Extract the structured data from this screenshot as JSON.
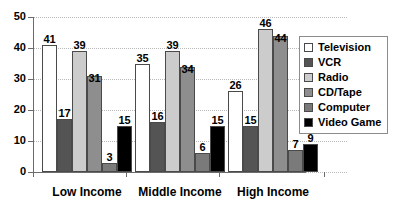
{
  "chart_data": {
    "type": "bar",
    "title": "",
    "xlabel": "",
    "ylabel": "",
    "ylim": [
      0,
      50
    ],
    "yticks": [
      0,
      10,
      20,
      30,
      40,
      50
    ],
    "grid": true,
    "legend_position": "right",
    "categories": [
      "Low Income",
      "Middle Income",
      "High Income"
    ],
    "series": [
      {
        "name": "Television",
        "color": "#ffffff",
        "values": [
          41,
          35,
          26
        ]
      },
      {
        "name": "VCR",
        "color": "#545454",
        "values": [
          17,
          16,
          15
        ]
      },
      {
        "name": "Radio",
        "color": "#cccccc",
        "values": [
          39,
          39,
          46
        ]
      },
      {
        "name": "CD/Tape",
        "color": "#8e8e8e",
        "values": [
          31,
          34,
          44
        ]
      },
      {
        "name": "Computer",
        "color": "#7a7a7a",
        "values": [
          3,
          6,
          7
        ]
      },
      {
        "name": "Video Game",
        "color": "#000000",
        "values": [
          15,
          15,
          9
        ]
      }
    ]
  },
  "axis": {
    "y_tick_labels": [
      "50",
      "40",
      "30",
      "20",
      "10",
      "0"
    ]
  },
  "legend": {
    "items": [
      {
        "label": "Television",
        "color": "#ffffff"
      },
      {
        "label": "VCR",
        "color": "#545454"
      },
      {
        "label": "Radio",
        "color": "#cccccc"
      },
      {
        "label": "CD/Tape",
        "color": "#8e8e8e"
      },
      {
        "label": "Computer",
        "color": "#7a7a7a"
      },
      {
        "label": "Video Game",
        "color": "#000000"
      }
    ]
  },
  "labels": {
    "low_income": "Low Income",
    "middle_income": "Middle Income",
    "high_income": "High Income"
  }
}
